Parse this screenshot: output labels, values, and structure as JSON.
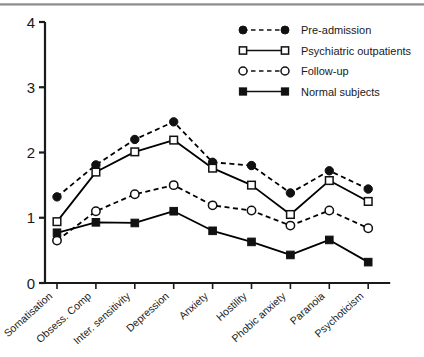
{
  "chart_data": {
    "type": "line",
    "title": "",
    "subtitle": "",
    "xlabel": "",
    "ylabel": "",
    "ylim": [
      0,
      4
    ],
    "yticks": [
      0,
      1,
      2,
      3,
      4
    ],
    "ytick_labels": [
      "0",
      "1",
      "2",
      "3",
      "4"
    ],
    "grid": false,
    "legend_position": "top-right",
    "categories": [
      "Somatisation",
      "Obsess. Comp",
      "Inter. sensitivity",
      "Depression",
      "Anxiety",
      "Hostility",
      "Phobic anxiety",
      "Paranoia",
      "Psychoticism"
    ],
    "series": [
      {
        "name": "Pre-admission",
        "marker": "filled-circle",
        "linestyle": "dashed",
        "color": "#000000",
        "values": [
          1.32,
          1.81,
          2.2,
          2.47,
          1.85,
          1.8,
          1.38,
          1.72,
          1.44
        ]
      },
      {
        "name": "Psychiatric outpatients",
        "marker": "open-square",
        "linestyle": "solid",
        "color": "#000000",
        "values": [
          0.94,
          1.7,
          2.01,
          2.19,
          1.76,
          1.5,
          1.05,
          1.57,
          1.25
        ]
      },
      {
        "name": "Follow-up",
        "marker": "open-circle",
        "linestyle": "dashed",
        "color": "#000000",
        "values": [
          0.65,
          1.1,
          1.36,
          1.5,
          1.19,
          1.11,
          0.88,
          1.11,
          0.84
        ]
      },
      {
        "name": "Normal subjects",
        "marker": "filled-square",
        "linestyle": "solid",
        "color": "#000000",
        "values": [
          0.77,
          0.93,
          0.92,
          1.1,
          0.8,
          0.63,
          0.43,
          0.66,
          0.32
        ]
      }
    ]
  },
  "legend": {
    "items": [
      {
        "label": "Pre-admission"
      },
      {
        "label": "Psychiatric outpatients"
      },
      {
        "label": "Follow-up"
      },
      {
        "label": "Normal subjects"
      }
    ]
  },
  "axes": {
    "y_tick_labels": [
      "4",
      "3",
      "2",
      "1",
      "0"
    ]
  }
}
